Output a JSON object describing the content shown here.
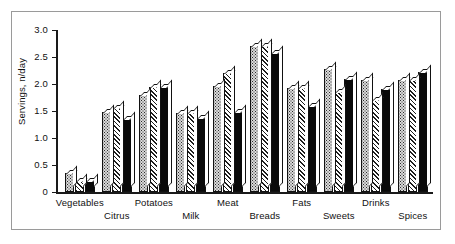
{
  "chart_data": {
    "type": "bar",
    "title": "",
    "xlabel": "",
    "ylabel": "Servings, n/day",
    "ylim": [
      0,
      3.0
    ],
    "ytick_labels": [
      "0",
      "0.5",
      "1.0",
      "1.5",
      "2.0",
      "2.5",
      "3.0"
    ],
    "ytick_values": [
      0,
      0.5,
      1.0,
      1.5,
      2.0,
      2.5,
      3.0
    ],
    "grid": false,
    "legend": "none",
    "categories": [
      "Vegetables",
      "Citrus",
      "Potatoes",
      "Milk",
      "Meat",
      "Breads",
      "Fats",
      "Sweets",
      "Drinks",
      "Spices"
    ],
    "series": [
      {
        "name": "series-1",
        "fill": "dotted-gray",
        "values": [
          0.35,
          1.48,
          1.8,
          1.47,
          1.97,
          2.7,
          1.93,
          2.28,
          2.07,
          2.07
        ]
      },
      {
        "name": "series-2",
        "fill": "diagonal-hatch",
        "values": [
          0.2,
          1.55,
          1.95,
          1.47,
          2.2,
          2.7,
          1.93,
          1.85,
          1.7,
          2.07
        ]
      },
      {
        "name": "series-3",
        "fill": "solid-black",
        "values": [
          0.2,
          1.35,
          1.95,
          1.37,
          1.48,
          2.58,
          1.6,
          2.1,
          1.9,
          2.22
        ]
      }
    ]
  },
  "axis": {
    "y_title": "Servings, n/day"
  },
  "colors": {
    "axis": "#1a1a1a",
    "frame": "#9a9a9a",
    "series_1": "#d9d9d9",
    "series_2": "#ffffff",
    "series_3": "#0a0a0a",
    "background": "#ffffff"
  }
}
